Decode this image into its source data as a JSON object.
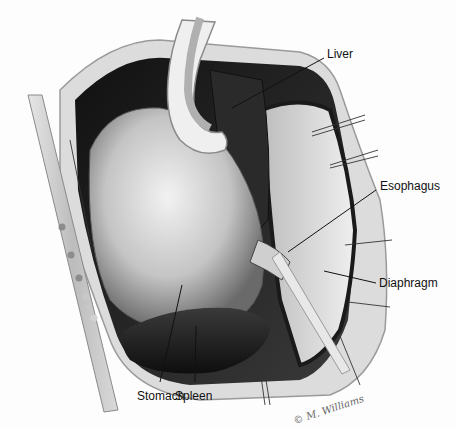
{
  "figure": {
    "type": "surgical anatomy illustration",
    "colors": {
      "background": "#fdfdfd",
      "dark_tissue": "#1e1e1e",
      "mid_tissue": "#8a8a8a",
      "light_tissue": "#d8d8d8",
      "label_text": "#111111"
    },
    "labels": [
      {
        "id": "liver",
        "text": "Liver"
      },
      {
        "id": "esophagus",
        "text": "Esophagus"
      },
      {
        "id": "diaphragm",
        "text": "Diaphragm"
      },
      {
        "id": "stomach",
        "text": "Stomach"
      },
      {
        "id": "spleen",
        "text": "Spleen"
      }
    ],
    "signature": "© M. Williams"
  }
}
